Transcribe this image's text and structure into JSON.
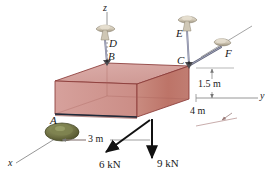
{
  "figure": {
    "type": "engineering-free-body-diagram",
    "background_color": "#ffffff"
  },
  "axes": {
    "z": {
      "label": "z"
    },
    "y": {
      "label": "y"
    },
    "x": {
      "label": "x"
    }
  },
  "points": {
    "A": {
      "label": "A",
      "kind": "ball-support"
    },
    "B": {
      "label": "B",
      "kind": "cable-attachment"
    },
    "C": {
      "label": "C",
      "kind": "cable-attachment"
    },
    "D": {
      "label": "D",
      "kind": "ceiling-anchor"
    },
    "E": {
      "label": "E",
      "kind": "ceiling-anchor"
    },
    "F": {
      "label": "F",
      "kind": "wall-anchor"
    }
  },
  "dimensions": [
    {
      "id": "height",
      "label": "1.5 m",
      "value": 1.5,
      "unit": "m"
    },
    {
      "id": "depth",
      "label": "4 m",
      "value": 4,
      "unit": "m"
    },
    {
      "id": "width",
      "label": "3 m",
      "value": 3,
      "unit": "m"
    }
  ],
  "forces": [
    {
      "id": "f6",
      "label": "6 kN",
      "magnitude": 6,
      "unit": "kN",
      "direction": "down-left-oblique"
    },
    {
      "id": "f9",
      "label": "9 kN",
      "magnitude": 9,
      "unit": "kN",
      "direction": "down-vertical"
    }
  ],
  "colors": {
    "slab_top": "#d9a7a3",
    "slab_front_left": "#d19792",
    "slab_front_right": "#c0796f",
    "slab_edge": "#8a3a38",
    "axis": "#7a7a7a",
    "force_arrow": "#111111",
    "anchor_body": "#d8d1c4",
    "anchor_shade": "#a39a86",
    "cable": "#6b6f8a",
    "support_a": "#6e7043",
    "support_a_dark": "#4c4e2c",
    "dim_line": "#777777"
  }
}
